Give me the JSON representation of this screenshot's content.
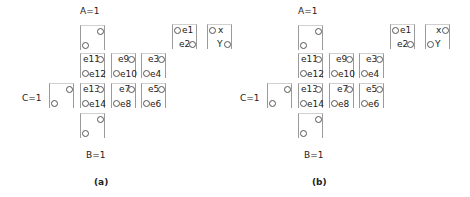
{
  "panels": [
    {
      "caption": "(a)",
      "labels": {
        "A": "A=1",
        "B": "B=1",
        "C": "C=1"
      },
      "cells": {
        "e1": "e1",
        "e2": "e2",
        "x": "x",
        "Y": "Y",
        "e3": "e3",
        "e4": "e4",
        "e5": "e5",
        "e6": "e6",
        "e7": "e7",
        "e8": "e8",
        "e9": "e9",
        "e10": "e10",
        "e11": "e11",
        "e12": "e12",
        "e13": "e13",
        "e14": "e14"
      },
      "xy_circle_sides": {
        "x": "left",
        "Y": "right"
      }
    },
    {
      "caption": "(b)",
      "labels": {
        "A": "A=1",
        "B": "B=1",
        "C": "C=1"
      },
      "cells": {
        "e1": "e1",
        "e2": "e2",
        "x": "x",
        "Y": "Y",
        "e3": "e3",
        "e4": "e4",
        "e5": "e5",
        "e6": "e6",
        "e7": "e7",
        "e8": "e8",
        "e9": "e9",
        "e10": "e10",
        "e11": "e11",
        "e12": "e12",
        "e13": "e13",
        "e14": "e14"
      },
      "xy_circle_sides": {
        "x": "right",
        "Y": "left"
      }
    }
  ]
}
